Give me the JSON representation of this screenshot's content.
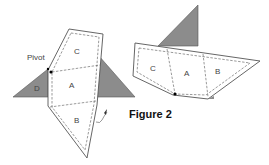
{
  "figure": {
    "caption": "Figure 2",
    "colors": {
      "shade": "#8c8c8c",
      "outline": "#555555",
      "fill": "#ffffff"
    },
    "left": {
      "pivot_label": "Pivot",
      "labels": {
        "A": "A",
        "B": "B",
        "C": "C",
        "D": "D"
      }
    },
    "right": {
      "labels": {
        "A": "A",
        "B": "B",
        "C": "C"
      }
    }
  }
}
